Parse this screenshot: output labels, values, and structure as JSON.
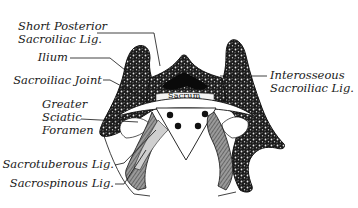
{
  "figure": {
    "title": "",
    "structure_label": "Sacrum",
    "labels_left": [
      {
        "id": "short-posterior-sacroiliac-lig",
        "line1": "Short Posterior",
        "line2": "Sacroiliac Lig."
      },
      {
        "id": "ilium",
        "line1": "Ilium"
      },
      {
        "id": "sacroiliac-joint",
        "line1": "Sacroiliac Joint"
      },
      {
        "id": "greater-sciatic-foramen",
        "line1": "Greater",
        "line2": "Sciatic",
        "line3": "Foramen"
      },
      {
        "id": "sacrotuberous-lig",
        "line1": "Sacrotuberous Lig."
      },
      {
        "id": "sacrospinous-lig",
        "line1": "Sacrospinous Lig."
      }
    ],
    "labels_right": [
      {
        "id": "interosseous-sacroiliac-lig",
        "line1": "Interosseous",
        "line2": "Sacroiliac Lig."
      }
    ]
  }
}
